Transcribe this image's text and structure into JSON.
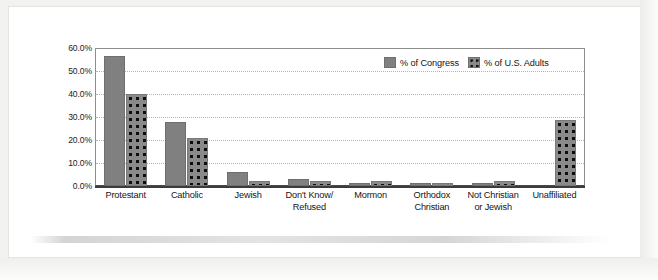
{
  "chart_data": {
    "type": "bar",
    "title": "",
    "subtitle": "",
    "xlabel": "",
    "ylabel": "",
    "ylim": [
      0,
      60
    ],
    "ytick_values": [
      0,
      10,
      20,
      30,
      40,
      50,
      60
    ],
    "ytick_labels": [
      "0.0%",
      "10.0%",
      "20.0%",
      "30.0%",
      "40.0%",
      "50.0%",
      "60.0%"
    ],
    "grid": true,
    "grid_style": "dotted-horizontal",
    "legend_position": "top-right-inside",
    "categories": [
      "Protestant",
      "Catholic",
      "Jewish",
      "Don't Know/ Refused",
      "Mormon",
      "Orthodox Christian",
      "Not Christian or Jewish",
      "Unaffiliated"
    ],
    "category_lines": [
      [
        "Protestant"
      ],
      [
        "Catholic"
      ],
      [
        "Jewish"
      ],
      [
        "Don't Know/",
        "Refused"
      ],
      [
        "Mormon"
      ],
      [
        "Orthodox",
        "Christian"
      ],
      [
        "Not Christian",
        "or Jewish"
      ],
      [
        "Unaffiliated"
      ]
    ],
    "series": [
      {
        "name": "% of Congress",
        "fill": "solid",
        "color": "#808080",
        "values": [
          56.5,
          28.0,
          6.0,
          3.0,
          1.0,
          0.5,
          1.0,
          0.0
        ]
      },
      {
        "name": "% of U.S. Adults",
        "fill": "dotted",
        "color": "#8a8a8a",
        "values": [
          40.0,
          21.0,
          2.0,
          2.0,
          2.0,
          0.5,
          2.0,
          28.5
        ]
      }
    ]
  },
  "legend": {
    "items": [
      {
        "label": "% of Congress",
        "fill": "solid"
      },
      {
        "label": "% of U.S. Adults",
        "fill": "dotted"
      }
    ]
  }
}
